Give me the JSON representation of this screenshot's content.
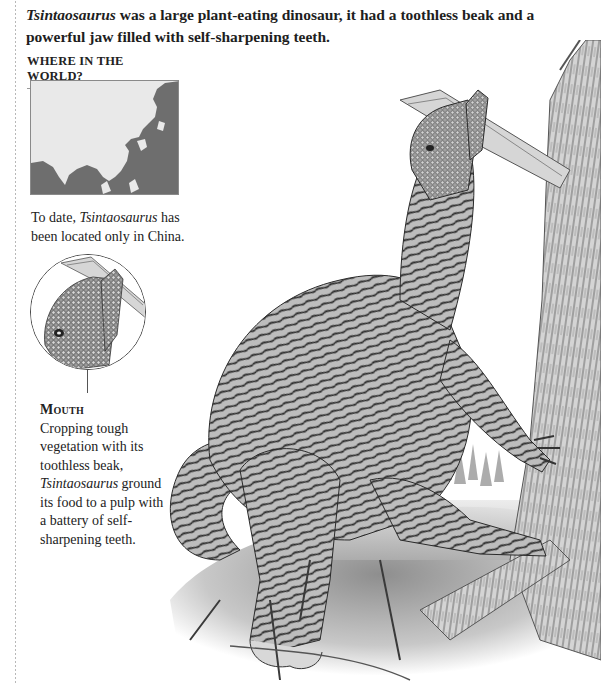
{
  "intro": {
    "species": "Tsintaosaurus",
    "text_after_species": " was a large plant-eating dinosaur, it had a toothless beak and a powerful jaw filled with self-sharpening teeth."
  },
  "where_in_world": {
    "heading": "WHERE IN THE WORLD?",
    "map_region": "East Asia",
    "map_colors": {
      "land_highlight": "#6e6e6e",
      "background": "#e9e9e9"
    },
    "caption_prefix": "To date, ",
    "caption_species": "Tsintaosaurus",
    "caption_suffix": " has been located only in China."
  },
  "inset": {
    "subject": "close-up of head and beak",
    "label_title": "Mouth",
    "label_line1": "Cropping tough vegetation with its toothless beak, ",
    "label_species": "Tsintaosaurus",
    "label_line2": " ground its food to a pulp with a battery of self-sharpening teeth."
  },
  "illustration": {
    "subject": "Tsintaosaurus rearing up against a tree, feeding on a branch",
    "style": "monochrome pencil illustration"
  }
}
